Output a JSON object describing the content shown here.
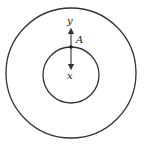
{
  "diagram": {
    "type": "concentric-circles",
    "outer_circle": {
      "cx": 71,
      "cy": 73,
      "r": 65
    },
    "inner_circle": {
      "cx": 71,
      "cy": 75,
      "r": 28
    },
    "point": {
      "label": "A",
      "x": 71,
      "y": 47
    },
    "arrows": [
      {
        "label": "y",
        "direction": "up",
        "from": [
          71,
          47
        ],
        "to": [
          71,
          31
        ]
      },
      {
        "label": "x",
        "direction": "down",
        "from": [
          71,
          47
        ],
        "to": [
          71,
          68
        ]
      }
    ],
    "labels": {
      "y": "y",
      "a": "A",
      "x": "x"
    },
    "stroke_color": "#333333"
  }
}
